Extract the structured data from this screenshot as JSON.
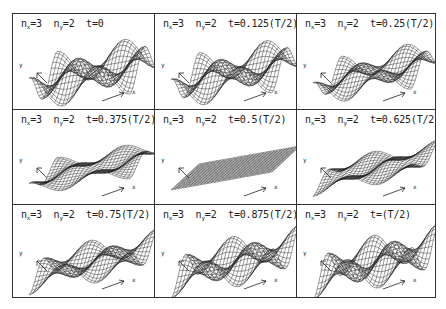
{
  "figure": {
    "line_color": "#222222",
    "background": "#ffffff",
    "axis_labels": {
      "x": "x",
      "y": "y"
    },
    "panels": [
      {
        "nx": "3",
        "ny": "2",
        "t": "t=0",
        "phase": 0.0
      },
      {
        "nx": "3",
        "ny": "2",
        "t": "t=0.125(T/2)",
        "phase": 0.125
      },
      {
        "nx": "3",
        "ny": "2",
        "t": "t=0.25(T/2)",
        "phase": 0.25
      },
      {
        "nx": "3",
        "ny": "2",
        "t": "t=0.375(T/2)",
        "phase": 0.375
      },
      {
        "nx": "3",
        "ny": "2",
        "t": "t=0.5(T/2)",
        "phase": 0.5
      },
      {
        "nx": "3",
        "ny": "2",
        "t": "t=0.625(T/2)",
        "phase": 0.625
      },
      {
        "nx": "3",
        "ny": "2",
        "t": "t=0.75(T/2)",
        "phase": 0.75
      },
      {
        "nx": "3",
        "ny": "2",
        "t": "t=0.875(T/2)",
        "phase": 0.875
      },
      {
        "nx": "3",
        "ny": "2",
        "t": "t=(T/2)",
        "phase": 1.0
      }
    ]
  }
}
